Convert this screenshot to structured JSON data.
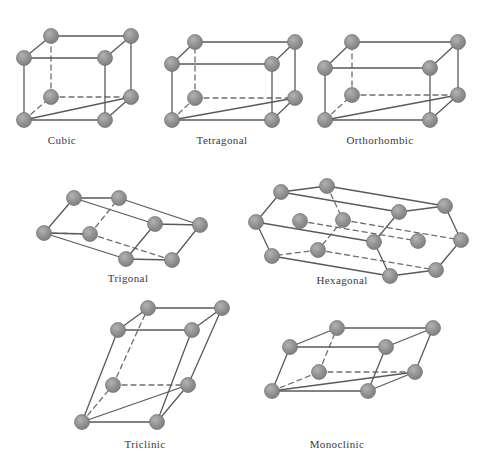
{
  "figure": {
    "background_color": "#ffffff",
    "atom_color": "#8d8d8d",
    "atom_stroke_color": "#6f6f6f",
    "edge_color": "#5a5a5a",
    "hidden_edge_color": "#6e6e6e",
    "label_color": "#3a3a3a",
    "atom_radius": 7.5,
    "edge_width": 1.3,
    "hidden_edge_dash": "5,4"
  },
  "cells": [
    {
      "id": "cubic",
      "label": "Cubic",
      "label_x": 62,
      "label_y": 134,
      "atoms": [
        {
          "x": 24,
          "y": 120,
          "hidden": false
        },
        {
          "x": 105,
          "y": 120,
          "hidden": false
        },
        {
          "x": 24,
          "y": 58,
          "hidden": false
        },
        {
          "x": 105,
          "y": 58,
          "hidden": false
        },
        {
          "x": 51,
          "y": 97,
          "hidden": true
        },
        {
          "x": 131,
          "y": 97,
          "hidden": false
        },
        {
          "x": 51,
          "y": 36,
          "hidden": false
        },
        {
          "x": 131,
          "y": 36,
          "hidden": false
        }
      ],
      "solid_edges": [
        [
          0,
          1
        ],
        [
          0,
          2
        ],
        [
          1,
          3
        ],
        [
          2,
          3
        ],
        [
          5,
          7
        ],
        [
          6,
          7
        ],
        [
          1,
          5
        ],
        [
          2,
          6
        ],
        [
          3,
          7
        ],
        [
          0,
          5
        ]
      ],
      "hidden_edges": [
        [
          4,
          5
        ],
        [
          4,
          6
        ],
        [
          0,
          4
        ]
      ]
    },
    {
      "id": "tetragonal",
      "label": "Tetragonal",
      "label_x": 222,
      "label_y": 134,
      "atoms": [
        {
          "x": 172,
          "y": 120,
          "hidden": false
        },
        {
          "x": 272,
          "y": 120,
          "hidden": false
        },
        {
          "x": 172,
          "y": 64,
          "hidden": false
        },
        {
          "x": 272,
          "y": 64,
          "hidden": false
        },
        {
          "x": 195,
          "y": 98,
          "hidden": true
        },
        {
          "x": 295,
          "y": 98,
          "hidden": false
        },
        {
          "x": 195,
          "y": 42,
          "hidden": false
        },
        {
          "x": 295,
          "y": 42,
          "hidden": false
        }
      ],
      "solid_edges": [
        [
          0,
          1
        ],
        [
          0,
          2
        ],
        [
          1,
          3
        ],
        [
          2,
          3
        ],
        [
          5,
          7
        ],
        [
          6,
          7
        ],
        [
          1,
          5
        ],
        [
          2,
          6
        ],
        [
          3,
          7
        ],
        [
          0,
          5
        ]
      ],
      "hidden_edges": [
        [
          4,
          5
        ],
        [
          4,
          6
        ],
        [
          0,
          4
        ]
      ]
    },
    {
      "id": "orthorhombic",
      "label": "Orthorhombic",
      "label_x": 380,
      "label_y": 134,
      "atoms": [
        {
          "x": 325,
          "y": 120,
          "hidden": false
        },
        {
          "x": 430,
          "y": 120,
          "hidden": false
        },
        {
          "x": 325,
          "y": 68,
          "hidden": false
        },
        {
          "x": 430,
          "y": 68,
          "hidden": false
        },
        {
          "x": 352,
          "y": 95,
          "hidden": true
        },
        {
          "x": 458,
          "y": 95,
          "hidden": false
        },
        {
          "x": 352,
          "y": 42,
          "hidden": false
        },
        {
          "x": 458,
          "y": 42,
          "hidden": false
        }
      ],
      "solid_edges": [
        [
          0,
          1
        ],
        [
          0,
          2
        ],
        [
          1,
          3
        ],
        [
          2,
          3
        ],
        [
          5,
          7
        ],
        [
          6,
          7
        ],
        [
          1,
          5
        ],
        [
          2,
          6
        ],
        [
          3,
          7
        ],
        [
          0,
          5
        ]
      ],
      "hidden_edges": [
        [
          4,
          5
        ],
        [
          4,
          6
        ],
        [
          0,
          4
        ]
      ]
    },
    {
      "id": "trigonal",
      "label": "Trigonal",
      "label_x": 128,
      "label_y": 272,
      "atoms": [
        {
          "x": 44,
          "y": 233,
          "hidden": false
        },
        {
          "x": 126,
          "y": 259,
          "hidden": false
        },
        {
          "x": 155,
          "y": 224,
          "hidden": false
        },
        {
          "x": 74,
          "y": 198,
          "hidden": false
        },
        {
          "x": 90,
          "y": 234,
          "hidden": true
        },
        {
          "x": 172,
          "y": 260,
          "hidden": false
        },
        {
          "x": 200,
          "y": 225,
          "hidden": false
        },
        {
          "x": 119,
          "y": 198,
          "hidden": false
        }
      ],
      "solid_edges": [
        [
          0,
          1
        ],
        [
          1,
          2
        ],
        [
          2,
          3
        ],
        [
          3,
          0
        ],
        [
          5,
          6
        ],
        [
          6,
          7
        ],
        [
          2,
          6
        ],
        [
          3,
          7
        ],
        [
          1,
          5
        ],
        [
          0,
          4
        ]
      ],
      "hidden_edges": [
        [
          4,
          5
        ],
        [
          4,
          7
        ],
        [
          0,
          4
        ]
      ]
    },
    {
      "id": "hexagonal",
      "label": "Hexagonal",
      "label_x": 342,
      "label_y": 274,
      "atoms": [
        {
          "x": 272,
          "y": 256,
          "hidden": false
        },
        {
          "x": 256,
          "y": 222,
          "hidden": false
        },
        {
          "x": 281,
          "y": 192,
          "hidden": false
        },
        {
          "x": 327,
          "y": 186,
          "hidden": false
        },
        {
          "x": 343,
          "y": 220,
          "hidden": true
        },
        {
          "x": 318,
          "y": 250,
          "hidden": true
        },
        {
          "x": 300,
          "y": 221,
          "hidden": false
        },
        {
          "x": 390,
          "y": 276,
          "hidden": false
        },
        {
          "x": 374,
          "y": 242,
          "hidden": false
        },
        {
          "x": 399,
          "y": 212,
          "hidden": false
        },
        {
          "x": 445,
          "y": 206,
          "hidden": false
        },
        {
          "x": 461,
          "y": 240,
          "hidden": false
        },
        {
          "x": 436,
          "y": 270,
          "hidden": false
        },
        {
          "x": 418,
          "y": 241,
          "hidden": false
        }
      ],
      "solid_edges": [
        [
          0,
          1
        ],
        [
          1,
          2
        ],
        [
          2,
          3
        ],
        [
          7,
          8
        ],
        [
          8,
          9
        ],
        [
          9,
          10
        ],
        [
          10,
          11
        ],
        [
          11,
          12
        ],
        [
          12,
          7
        ],
        [
          0,
          7
        ],
        [
          1,
          8
        ],
        [
          2,
          9
        ],
        [
          3,
          10
        ]
      ],
      "hidden_edges": [
        [
          3,
          4
        ],
        [
          4,
          5
        ],
        [
          5,
          0
        ],
        [
          4,
          11
        ],
        [
          5,
          12
        ],
        [
          6,
          13
        ]
      ]
    },
    {
      "id": "triclinic",
      "label": "Triclinic",
      "label_x": 145,
      "label_y": 438,
      "atoms": [
        {
          "x": 82,
          "y": 422,
          "hidden": false
        },
        {
          "x": 157,
          "y": 422,
          "hidden": false
        },
        {
          "x": 118,
          "y": 330,
          "hidden": false
        },
        {
          "x": 192,
          "y": 330,
          "hidden": false
        },
        {
          "x": 113,
          "y": 385,
          "hidden": true
        },
        {
          "x": 188,
          "y": 385,
          "hidden": false
        },
        {
          "x": 148,
          "y": 308,
          "hidden": false
        },
        {
          "x": 222,
          "y": 308,
          "hidden": false
        }
      ],
      "solid_edges": [
        [
          0,
          1
        ],
        [
          0,
          2
        ],
        [
          1,
          3
        ],
        [
          2,
          3
        ],
        [
          5,
          7
        ],
        [
          6,
          7
        ],
        [
          1,
          5
        ],
        [
          2,
          6
        ],
        [
          3,
          7
        ],
        [
          0,
          5
        ]
      ],
      "hidden_edges": [
        [
          4,
          5
        ],
        [
          4,
          6
        ],
        [
          0,
          4
        ]
      ]
    },
    {
      "id": "monoclinic",
      "label": "Monoclinic",
      "label_x": 337,
      "label_y": 438,
      "atoms": [
        {
          "x": 272,
          "y": 391,
          "hidden": false
        },
        {
          "x": 368,
          "y": 391,
          "hidden": false
        },
        {
          "x": 290,
          "y": 347,
          "hidden": false
        },
        {
          "x": 386,
          "y": 347,
          "hidden": false
        },
        {
          "x": 319,
          "y": 372,
          "hidden": true
        },
        {
          "x": 415,
          "y": 372,
          "hidden": false
        },
        {
          "x": 337,
          "y": 328,
          "hidden": false
        },
        {
          "x": 433,
          "y": 328,
          "hidden": false
        }
      ],
      "solid_edges": [
        [
          0,
          1
        ],
        [
          0,
          2
        ],
        [
          1,
          3
        ],
        [
          2,
          3
        ],
        [
          5,
          7
        ],
        [
          6,
          7
        ],
        [
          1,
          5
        ],
        [
          2,
          6
        ],
        [
          3,
          7
        ],
        [
          0,
          5
        ]
      ],
      "hidden_edges": [
        [
          4,
          5
        ],
        [
          4,
          6
        ],
        [
          0,
          4
        ]
      ]
    }
  ]
}
